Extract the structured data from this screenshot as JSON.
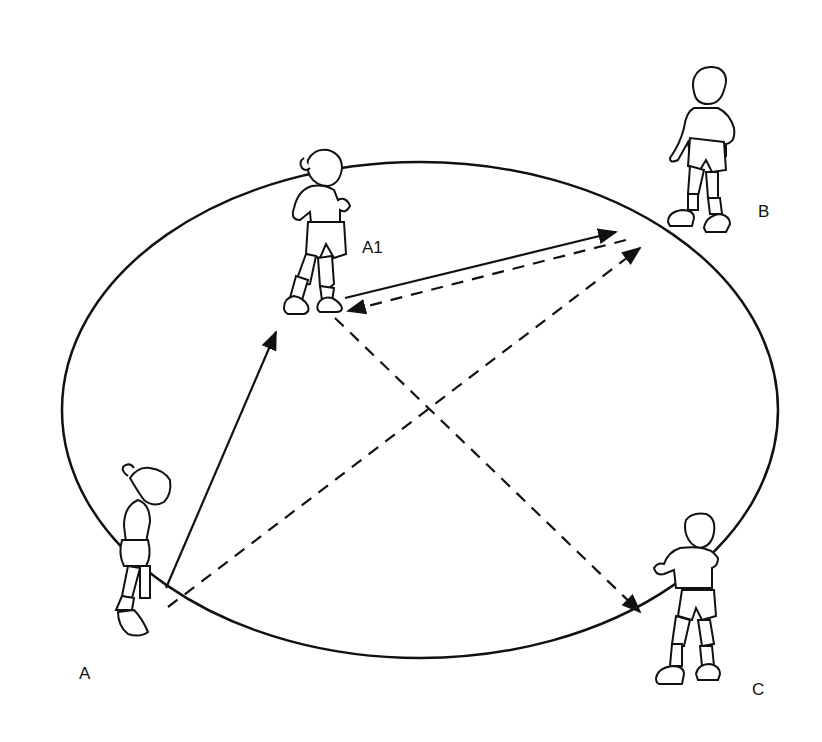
{
  "diagram": {
    "type": "soccer-passing-drill",
    "players": [
      {
        "id": "A",
        "label": "A"
      },
      {
        "id": "A1",
        "label": "A1"
      },
      {
        "id": "B",
        "label": "B"
      },
      {
        "id": "C",
        "label": "C"
      }
    ],
    "paths": [
      {
        "from": "A",
        "to": "A1",
        "style": "solid",
        "meaning": "pass/run"
      },
      {
        "from": "A1",
        "to": "B",
        "style": "solid",
        "meaning": "pass"
      },
      {
        "from": "B",
        "to": "A1",
        "style": "dashed",
        "meaning": "return"
      },
      {
        "from": "A",
        "to": "B",
        "style": "dashed",
        "meaning": "run"
      },
      {
        "from": "A1",
        "to": "C",
        "style": "dashed",
        "meaning": "run"
      }
    ],
    "colors": {
      "ink": "#111111",
      "background": "#ffffff"
    }
  }
}
